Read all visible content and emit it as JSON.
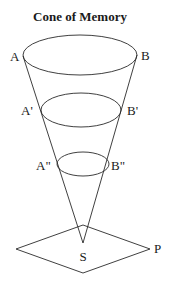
{
  "title": "Cone of Memory",
  "colors": {
    "stroke": "#2a2a2a",
    "text": "#1a1a1a",
    "background": "#ffffff"
  },
  "labels": {
    "A": "A",
    "B": "B",
    "A_prime": "A'",
    "B_prime": "B'",
    "A_double_prime": "A\"",
    "B_double_prime": "B\"",
    "S": "S",
    "P": "P"
  },
  "shapes": {
    "ellipses": [
      {
        "name": "AB",
        "cx": 80,
        "cy": 55,
        "rx": 57,
        "ry": 20
      },
      {
        "name": "A'B'",
        "cx": 81,
        "cy": 110,
        "rx": 40,
        "ry": 17
      },
      {
        "name": "A\"B\"",
        "cx": 83,
        "cy": 164,
        "rx": 26,
        "ry": 12
      }
    ],
    "apex_S": {
      "x": 83,
      "y": 243
    },
    "plane_P": {
      "top": [
        83,
        225
      ],
      "right": [
        150,
        249
      ],
      "bottom": [
        83,
        273
      ],
      "left": [
        16,
        249
      ]
    }
  }
}
